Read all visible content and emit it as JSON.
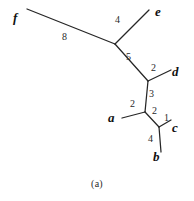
{
  "figure": {
    "caption": "(a)",
    "type": "unrooted-weighted-tree",
    "stroke_color": "#262626",
    "background_color": "#ffffff",
    "label_color": "#111111"
  },
  "taxa": [
    {
      "id": "f",
      "label": "f",
      "x": 17,
      "y": 18
    },
    {
      "id": "e",
      "label": "e",
      "x": 160,
      "y": 12
    },
    {
      "id": "d",
      "label": "d",
      "x": 177,
      "y": 72
    },
    {
      "id": "a",
      "label": "a",
      "x": 113,
      "y": 118
    },
    {
      "id": "c",
      "label": "c",
      "x": 176,
      "y": 128
    },
    {
      "id": "b",
      "label": "b",
      "x": 158,
      "y": 158
    }
  ],
  "internal_nodes": [
    {
      "id": "A",
      "x": 115,
      "y": 44
    },
    {
      "id": "B",
      "x": 148,
      "y": 81
    },
    {
      "id": "C",
      "x": 145,
      "y": 112
    },
    {
      "id": "D",
      "x": 159,
      "y": 127
    }
  ],
  "tip_points": [
    {
      "id": "f",
      "x": 27,
      "y": 9
    },
    {
      "id": "e",
      "x": 149,
      "y": 10
    },
    {
      "id": "d",
      "x": 171,
      "y": 70
    },
    {
      "id": "a",
      "x": 122,
      "y": 118
    },
    {
      "id": "c",
      "x": 171,
      "y": 120
    },
    {
      "id": "b",
      "x": 161,
      "y": 152
    }
  ],
  "edges": [
    {
      "id": "f-A",
      "from": "f",
      "to": "A",
      "weight": "8",
      "label_x": 64,
      "label_y": 33
    },
    {
      "id": "A-e",
      "from": "A",
      "to": "e",
      "weight": "4",
      "label_x": 117,
      "label_y": 18
    },
    {
      "id": "A-B",
      "from": "A",
      "to": "B",
      "weight": "5",
      "label_x": 127,
      "label_y": 54
    },
    {
      "id": "B-d",
      "from": "B",
      "to": "d",
      "weight": "2",
      "label_x": 152,
      "label_y": 67
    },
    {
      "id": "B-C",
      "from": "B",
      "to": "C",
      "weight": "3",
      "label_x": 150,
      "label_y": 91
    },
    {
      "id": "C-a",
      "from": "C",
      "to": "a",
      "weight": "2",
      "label_x": 131,
      "label_y": 101
    },
    {
      "id": "C-D",
      "from": "C",
      "to": "D",
      "weight": "2",
      "label_x": 153,
      "label_y": 108
    },
    {
      "id": "D-c",
      "from": "D",
      "to": "c",
      "weight": "1",
      "label_x": 165,
      "label_y": 116
    },
    {
      "id": "D-b",
      "from": "D",
      "to": "b",
      "weight": "4",
      "label_x": 149,
      "label_y": 137
    }
  ]
}
